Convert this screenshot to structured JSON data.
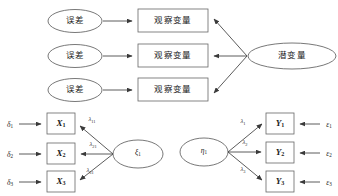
{
  "figure": {
    "type": "sem-path-diagram",
    "panels": [
      {
        "id": "conceptual",
        "name": "conceptual-measurement-model",
        "errors": [
          {
            "id": "err-1",
            "label": "误差"
          },
          {
            "id": "err-2",
            "label": "误差"
          },
          {
            "id": "err-3",
            "label": "误差"
          }
        ],
        "observed": [
          {
            "id": "obs-1",
            "label": "观察变量"
          },
          {
            "id": "obs-2",
            "label": "观察变量"
          },
          {
            "id": "obs-3",
            "label": "观察变量"
          }
        ],
        "latent": {
          "id": "latent-1",
          "label": "潜变量"
        }
      },
      {
        "id": "exogenous",
        "name": "exogenous-measurement-model",
        "factor": {
          "id": "ksi-1",
          "symbol": "ξ",
          "subscript": "1"
        },
        "errors": [
          {
            "id": "delta-1",
            "symbol": "δ",
            "subscript": "1"
          },
          {
            "id": "delta-2",
            "symbol": "δ",
            "subscript": "2"
          },
          {
            "id": "delta-3",
            "symbol": "δ",
            "subscript": "3"
          }
        ],
        "indicators": [
          {
            "id": "x-1",
            "symbol": "X",
            "subscript": "1"
          },
          {
            "id": "x-2",
            "symbol": "X",
            "subscript": "2"
          },
          {
            "id": "x-3",
            "symbol": "X",
            "subscript": "3"
          }
        ],
        "loadings": [
          {
            "id": "lambda-11",
            "symbol": "λ",
            "subscript": "11"
          },
          {
            "id": "lambda-21",
            "symbol": "λ",
            "subscript": "21"
          },
          {
            "id": "lambda-31",
            "symbol": "λ",
            "subscript": "31"
          }
        ]
      },
      {
        "id": "endogenous",
        "name": "endogenous-measurement-model",
        "factor": {
          "id": "eta-1",
          "symbol": "η",
          "subscript": "1"
        },
        "errors": [
          {
            "id": "epsilon-1",
            "symbol": "ε",
            "subscript": "1"
          },
          {
            "id": "epsilon-2",
            "symbol": "ε",
            "subscript": "2"
          },
          {
            "id": "epsilon-3",
            "symbol": "ε",
            "subscript": "3"
          }
        ],
        "indicators": [
          {
            "id": "y-1",
            "symbol": "Y",
            "subscript": "1"
          },
          {
            "id": "y-2",
            "symbol": "Y",
            "subscript": "2"
          },
          {
            "id": "y-3",
            "symbol": "Y",
            "subscript": "3"
          }
        ],
        "loadings": [
          {
            "id": "lambda-1",
            "symbol": "λ",
            "subscript": "1"
          },
          {
            "id": "lambda-2",
            "symbol": "λ",
            "subscript": "2"
          },
          {
            "id": "lambda-3",
            "symbol": "λ",
            "subscript": "3"
          }
        ]
      }
    ],
    "colors": {
      "background": "#ffffff",
      "stroke": "#555555",
      "edge": "#4a4a4a",
      "text": "#1a1a1a"
    }
  }
}
